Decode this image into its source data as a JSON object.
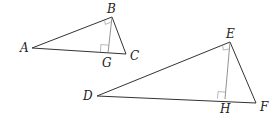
{
  "diagram": {
    "type": "geometry",
    "colors": {
      "line": "#333333",
      "altitude": "#777777",
      "background": "#ffffff"
    },
    "triangles": [
      {
        "name": "triangle-abc",
        "vertices": {
          "A": [
            32,
            48
          ],
          "B": [
            112,
            17
          ],
          "C": [
            126,
            54
          ]
        },
        "right_angle_at": "B",
        "altitude": {
          "from": "B",
          "foot": "G",
          "foot_point": [
            108,
            53
          ]
        }
      },
      {
        "name": "triangle-def",
        "vertices": {
          "D": [
            97,
            96
          ],
          "E": [
            230,
            42
          ],
          "F": [
            256,
            103
          ]
        },
        "right_angle_at": "E",
        "altitude": {
          "from": "E",
          "foot": "H",
          "foot_point": [
            225,
            99
          ]
        }
      }
    ],
    "labels": {
      "A": "A",
      "B": "B",
      "C": "C",
      "G": "G",
      "D": "D",
      "E": "E",
      "F": "F",
      "H": "H"
    }
  }
}
